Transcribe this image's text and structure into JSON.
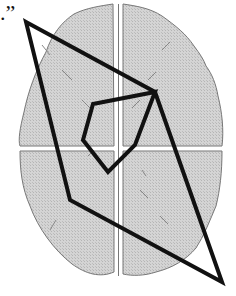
{
  "figure": {
    "label_mark": ".”",
    "colors": {
      "brain_fill": "#cfcfcf",
      "brain_outline": "#777777",
      "polygon_stroke": "#111111",
      "background": "#ffffff"
    },
    "outer_polygon": [
      [
        26,
        22
      ],
      [
        155,
        92
      ],
      [
        222,
        282
      ],
      [
        70,
        200
      ]
    ],
    "inner_polygon": [
      [
        93,
        104
      ],
      [
        155,
        92
      ],
      [
        135,
        145
      ],
      [
        108,
        172
      ],
      [
        83,
        140
      ]
    ]
  }
}
